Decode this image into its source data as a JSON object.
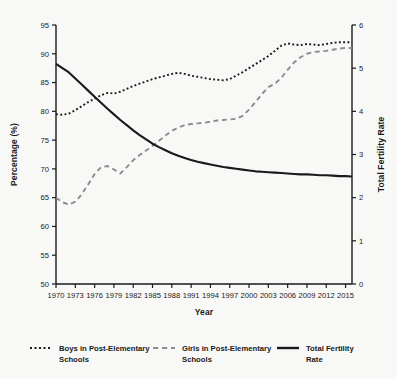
{
  "figure": {
    "background_color": "#f8f8f7",
    "ink_color": "#1a1a1a"
  },
  "axes": {
    "x_title": "Year",
    "y_left_title": "Percentage (%)",
    "y_right_title": "Total Fertility Rate",
    "x_ticks": [
      "1970",
      "1973",
      "1976",
      "1979",
      "1982",
      "1985",
      "1988",
      "1991",
      "1994",
      "1997",
      "2000",
      "2003",
      "2006",
      "2009",
      "2012",
      "2015"
    ],
    "y_left_ticks": [
      "50",
      "55",
      "60",
      "65",
      "70",
      "75",
      "80",
      "85",
      "90",
      "95"
    ],
    "y_right_ticks": [
      "0",
      "1",
      "2",
      "3",
      "4",
      "5",
      "6"
    ]
  },
  "legend": {
    "items": [
      {
        "label": "Boys in Post-Elementary Schools",
        "style": "dotted",
        "color": "#1a1a1a"
      },
      {
        "label": "Girls in Post-Elementary Schools",
        "style": "dashed",
        "color": "#8c8c8c"
      },
      {
        "label": "Total Fertility Rate",
        "style": "solid",
        "color": "#1a1a1a"
      }
    ]
  },
  "chart_data": {
    "type": "line",
    "title": "",
    "xlabel": "Year",
    "ylabel": "Percentage (%)",
    "y2label": "Total Fertility Rate",
    "xlim": [
      1970,
      2016
    ],
    "ylim": [
      50,
      95
    ],
    "y2lim": [
      0,
      6
    ],
    "grid": false,
    "legend_position": "bottom",
    "x": [
      1970,
      1971,
      1972,
      1973,
      1974,
      1975,
      1976,
      1977,
      1978,
      1979,
      1980,
      1981,
      1982,
      1983,
      1984,
      1985,
      1986,
      1987,
      1988,
      1989,
      1990,
      1991,
      1992,
      1993,
      1994,
      1995,
      1996,
      1997,
      1998,
      1999,
      2000,
      2001,
      2002,
      2003,
      2004,
      2005,
      2006,
      2007,
      2008,
      2009,
      2010,
      2011,
      2012,
      2013,
      2014,
      2015,
      2016
    ],
    "series": [
      {
        "name": "Boys in Post-Elementary Schools",
        "axis": "left",
        "units": "%",
        "style": "dotted",
        "color": "#1a1a1a",
        "values": [
          79.5,
          79.4,
          79.6,
          80.2,
          80.9,
          81.6,
          82.2,
          82.8,
          83.2,
          83.1,
          83.4,
          83.9,
          84.4,
          84.8,
          85.2,
          85.6,
          85.9,
          86.2,
          86.5,
          86.7,
          86.5,
          86.2,
          86.0,
          85.8,
          85.6,
          85.5,
          85.4,
          85.6,
          86.2,
          86.8,
          87.5,
          88.2,
          88.9,
          89.6,
          90.5,
          91.4,
          91.8,
          91.6,
          91.5,
          91.7,
          91.6,
          91.5,
          91.7,
          91.9,
          92.0,
          92.0,
          92.0
        ]
      },
      {
        "name": "Girls in Post-Elementary Schools",
        "axis": "left",
        "units": "%",
        "style": "dashed",
        "color": "#8c8c8c",
        "values": [
          65.0,
          64.2,
          63.8,
          64.3,
          65.6,
          67.3,
          69.1,
          70.3,
          70.5,
          69.9,
          69.2,
          70.3,
          71.5,
          72.4,
          73.2,
          74.0,
          74.9,
          75.8,
          76.6,
          77.2,
          77.6,
          77.8,
          77.9,
          78.0,
          78.2,
          78.4,
          78.5,
          78.6,
          78.7,
          79.2,
          80.3,
          81.6,
          83.0,
          84.2,
          84.8,
          85.8,
          87.2,
          88.5,
          89.4,
          90.0,
          90.3,
          90.4,
          90.5,
          90.7,
          90.9,
          91.0,
          91.0
        ]
      },
      {
        "name": "Total Fertility Rate",
        "axis": "right",
        "units": "births per woman",
        "style": "solid",
        "color": "#1a1a1a",
        "values": [
          5.1,
          5.0,
          4.9,
          4.76,
          4.62,
          4.48,
          4.34,
          4.2,
          4.06,
          3.93,
          3.8,
          3.68,
          3.56,
          3.45,
          3.35,
          3.25,
          3.17,
          3.1,
          3.03,
          2.97,
          2.92,
          2.87,
          2.83,
          2.8,
          2.77,
          2.74,
          2.71,
          2.69,
          2.67,
          2.65,
          2.63,
          2.61,
          2.6,
          2.59,
          2.58,
          2.57,
          2.56,
          2.55,
          2.54,
          2.54,
          2.53,
          2.52,
          2.52,
          2.51,
          2.5,
          2.5,
          2.49
        ]
      }
    ]
  }
}
